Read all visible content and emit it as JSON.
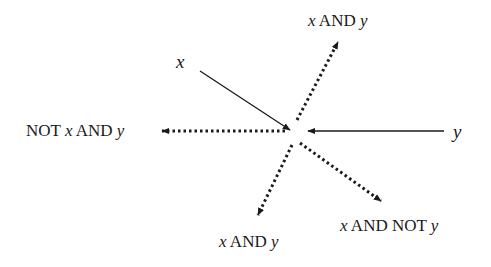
{
  "diagram": {
    "inputs": [
      {
        "id": "x",
        "label": "x",
        "x": 176,
        "y": 52
      },
      {
        "id": "y",
        "label": "y",
        "x": 453,
        "y": 122
      }
    ],
    "outputs": [
      {
        "id": "out-up",
        "parts": [
          {
            "t": "x",
            "i": true
          },
          {
            "t": " AND ",
            "i": false
          },
          {
            "t": "y",
            "i": true
          }
        ],
        "x": 308,
        "y": 12
      },
      {
        "id": "out-left",
        "parts": [
          {
            "t": "NOT ",
            "i": false
          },
          {
            "t": "x",
            "i": true
          },
          {
            "t": " AND ",
            "i": false
          },
          {
            "t": "y",
            "i": true
          }
        ],
        "x": 26,
        "y": 122
      },
      {
        "id": "out-downleft",
        "parts": [
          {
            "t": "x",
            "i": true
          },
          {
            "t": " AND ",
            "i": false
          },
          {
            "t": "y",
            "i": true
          }
        ],
        "x": 219,
        "y": 233
      },
      {
        "id": "out-downright",
        "parts": [
          {
            "t": "x",
            "i": true
          },
          {
            "t": " AND NOT ",
            "i": false
          },
          {
            "t": "y",
            "i": true
          }
        ],
        "x": 340,
        "y": 217
      }
    ],
    "arrows": [
      {
        "from": [
          200,
          71
        ],
        "to": [
          290,
          130
        ],
        "style": "solid"
      },
      {
        "from": [
          444,
          131
        ],
        "to": [
          308,
          131
        ],
        "style": "solid"
      },
      {
        "from": [
          297,
          120
        ],
        "to": [
          338,
          42
        ],
        "style": "dotted"
      },
      {
        "from": [
          285,
          131
        ],
        "to": [
          162,
          131
        ],
        "style": "dotted"
      },
      {
        "from": [
          292,
          145
        ],
        "to": [
          258,
          215
        ],
        "style": "dotted"
      },
      {
        "from": [
          300,
          143
        ],
        "to": [
          381,
          201
        ],
        "style": "dotted"
      }
    ],
    "colors": {
      "line": "#1a1a1a",
      "text": "#1a1a1a"
    }
  }
}
